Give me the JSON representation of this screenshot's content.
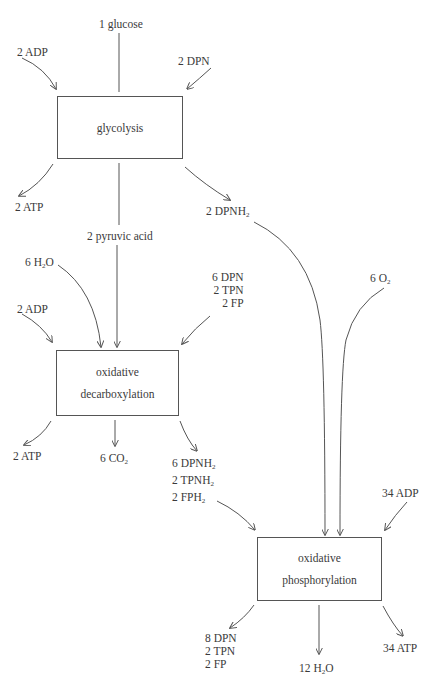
{
  "diagram": {
    "processes": {
      "glycolysis": {
        "label": "glycolysis"
      },
      "oxidative_decarboxylation": {
        "line1": "oxidative",
        "line2": "decarboxylation"
      },
      "oxidative_phosphorylation": {
        "line1": "oxidative",
        "line2": "phosphorylation"
      }
    },
    "glycolysis_inputs": {
      "glucose": "1 glucose",
      "adp": "2 ADP",
      "dpn": "2 DPN"
    },
    "glycolysis_outputs": {
      "atp": "2 ATP",
      "pyruvic_acid": "2 pyruvic acid",
      "dpnh2": {
        "text": "2 DPNH",
        "sub": "2"
      }
    },
    "decarboxylation_inputs": {
      "h2o": {
        "pre": "6 H",
        "sub": "2",
        "post": "O"
      },
      "adp": "2 ADP",
      "cofactors": [
        "6 DPN",
        "2 TPN",
        "2 FP"
      ]
    },
    "decarboxylation_outputs": {
      "atp": "2 ATP",
      "co2": {
        "pre": "6 CO",
        "sub": "2"
      },
      "reduced": [
        {
          "text": "6 DPNH",
          "sub": "2"
        },
        {
          "text": "2 TPNH",
          "sub": "2"
        },
        {
          "text": "2 FPH",
          "sub": "2"
        }
      ]
    },
    "phosphorylation_inputs": {
      "o2": {
        "pre": "6 O",
        "sub": "2"
      },
      "adp": "34 ADP"
    },
    "phosphorylation_outputs": {
      "cofactors": [
        "8 DPN",
        "2 TPN",
        "2 FP"
      ],
      "h2o": {
        "pre": "12 H",
        "sub": "2",
        "post": "O"
      },
      "atp": "34 ATP"
    }
  }
}
